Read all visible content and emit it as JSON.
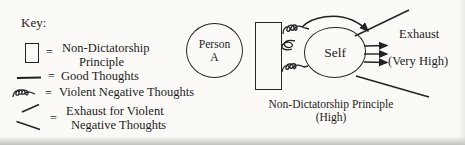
{
  "colors": {
    "ink": "#1d1d1d",
    "paper": "#fbfaf7"
  },
  "key": {
    "title": "Key:",
    "items": [
      {
        "symbol": "square-outline",
        "eq": "=",
        "label1": "Non-Dictatorship",
        "label2": "Principle"
      },
      {
        "symbol": "straight-line",
        "eq": "=",
        "label1": "Good Thoughts"
      },
      {
        "symbol": "squiggle",
        "eq": "=",
        "label1": "Violent Negative Thoughts"
      },
      {
        "symbol": "exhaust-lines",
        "eq": "=",
        "label1": "Exhaust for Violent",
        "label2": "Negative Thoughts"
      }
    ]
  },
  "diagram": {
    "person": {
      "line1": "Person",
      "line2": "A"
    },
    "self": "Self",
    "exhaust": "Exhaust",
    "very_high": "(Very High)",
    "caption1": "Non-Dictatorship Principle",
    "caption2": "(High)"
  }
}
